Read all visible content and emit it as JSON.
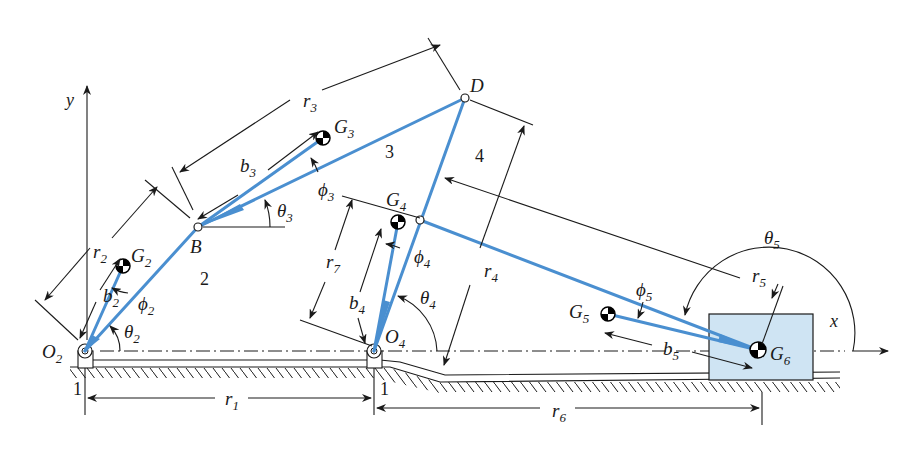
{
  "figure": {
    "colors": {
      "link": "#4a8fd0",
      "slider_fill": "#cfe4f3",
      "ink": "#1a1a1a"
    }
  },
  "axes": {
    "x_label": "x",
    "y_label": "y"
  },
  "points": {
    "O2": {
      "label": "O",
      "sub": "2",
      "x": 85,
      "y": 351
    },
    "O4": {
      "label": "O",
      "sub": "4",
      "x": 374,
      "y": 351
    },
    "B": {
      "label": "B",
      "x": 198,
      "y": 227
    },
    "C": {
      "x": 420,
      "y": 220
    },
    "D": {
      "label": "D",
      "x": 465,
      "y": 98
    },
    "G2": {
      "label": "G",
      "sub": "2",
      "x": 123,
      "y": 266
    },
    "G3": {
      "label": "G",
      "sub": "3",
      "x": 323,
      "y": 138
    },
    "G4": {
      "label": "G",
      "sub": "4",
      "x": 398,
      "y": 222
    },
    "G5": {
      "label": "G",
      "sub": "5",
      "x": 608,
      "y": 314
    },
    "G6": {
      "label": "G",
      "sub": "6",
      "x": 758,
      "y": 350
    }
  },
  "link_numbers": [
    {
      "text": "2",
      "x": 200,
      "y": 285
    },
    {
      "text": "3",
      "x": 385,
      "y": 158
    },
    {
      "text": "4",
      "x": 475,
      "y": 162
    },
    {
      "text": "1",
      "x": 73,
      "y": 395
    },
    {
      "text": "1",
      "x": 380,
      "y": 395
    }
  ],
  "dimension_labels": [
    {
      "sym": "r",
      "sub": "1",
      "x": 225,
      "y": 405
    },
    {
      "sym": "r",
      "sub": "2",
      "x": 93,
      "y": 258
    },
    {
      "sym": "r",
      "sub": "3",
      "x": 303,
      "y": 107
    },
    {
      "sym": "r",
      "sub": "4",
      "x": 484,
      "y": 277
    },
    {
      "sym": "r",
      "sub": "5",
      "x": 752,
      "y": 282
    },
    {
      "sym": "r",
      "sub": "6",
      "x": 552,
      "y": 417
    },
    {
      "sym": "r",
      "sub": "7",
      "x": 326,
      "y": 268
    },
    {
      "sym": "b",
      "sub": "2",
      "x": 103,
      "y": 302
    },
    {
      "sym": "b",
      "sub": "3",
      "x": 240,
      "y": 172
    },
    {
      "sym": "b",
      "sub": "4",
      "x": 349,
      "y": 309
    },
    {
      "sym": "b",
      "sub": "5",
      "x": 663,
      "y": 355
    }
  ],
  "angle_labels": [
    {
      "sym": "θ",
      "sub": "2",
      "x": 124,
      "y": 338
    },
    {
      "sym": "θ",
      "sub": "3",
      "x": 277,
      "y": 217
    },
    {
      "sym": "θ",
      "sub": "4",
      "x": 420,
      "y": 304
    },
    {
      "sym": "θ",
      "sub": "5",
      "x": 764,
      "y": 244
    },
    {
      "sym": "ϕ",
      "sub": "2",
      "x": 138,
      "y": 310
    },
    {
      "sym": "ϕ",
      "sub": "3",
      "x": 318,
      "y": 196
    },
    {
      "sym": "ϕ",
      "sub": "4",
      "x": 414,
      "y": 263
    },
    {
      "sym": "ϕ",
      "sub": "5",
      "x": 636,
      "y": 296
    }
  ]
}
